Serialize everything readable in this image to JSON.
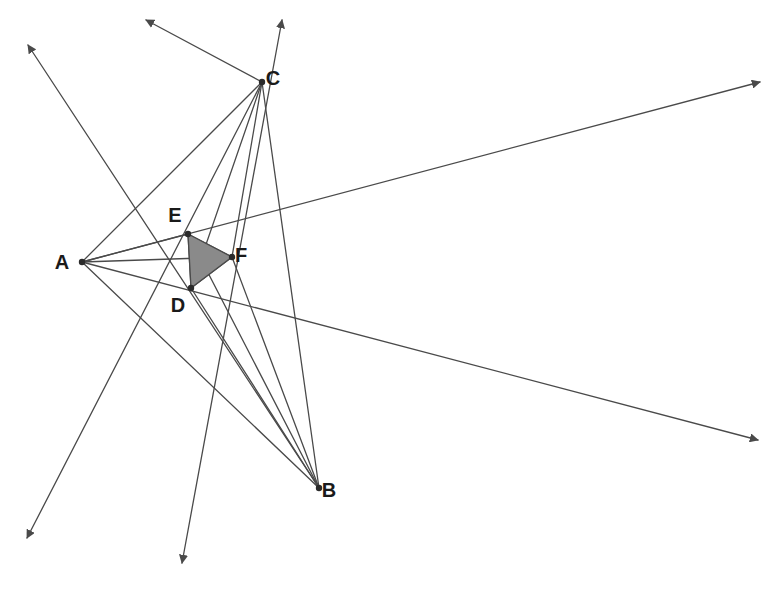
{
  "figure": {
    "width": 783,
    "height": 593,
    "background_color": "#ffffff",
    "line_color": "#4a4a4a",
    "line_width": 1.3,
    "vertex_color": "#2b2b2b",
    "vertex_radius": 3.2,
    "shaded_triangle": {
      "name": "triangle-def",
      "vertices": [
        "D",
        "E",
        "F"
      ],
      "fill_color": "#8a8a8a",
      "stroke_color": "#4a4a4a"
    },
    "points": [
      {
        "id": "A",
        "label": "A",
        "x": 82,
        "y": 262,
        "label_x": 62,
        "label_y": 269,
        "marker": true
      },
      {
        "id": "B",
        "label": "B",
        "x": 319,
        "y": 488,
        "label_x": 329,
        "label_y": 497,
        "marker": true
      },
      {
        "id": "C",
        "label": "C",
        "x": 262,
        "y": 82,
        "label_x": 273,
        "label_y": 85,
        "marker": true
      },
      {
        "id": "D",
        "label": "D",
        "x": 191,
        "y": 288,
        "label_x": 178,
        "label_y": 312,
        "marker": true
      },
      {
        "id": "E",
        "label": "E",
        "x": 188,
        "y": 234,
        "label_x": 175,
        "label_y": 222,
        "marker": true
      },
      {
        "id": "F",
        "label": "F",
        "x": 232,
        "y": 257,
        "label_x": 241,
        "label_y": 262,
        "marker": true
      }
    ],
    "segments": [
      {
        "name": "segment-a-c",
        "from": "A",
        "to": "C"
      },
      {
        "name": "segment-a-b",
        "from": "A",
        "to": "B"
      },
      {
        "name": "segment-c-b",
        "from": "C",
        "to": "B"
      },
      {
        "name": "segment-c-d",
        "from": "C",
        "to": "D"
      },
      {
        "name": "segment-c-f",
        "from": "C",
        "to": "F"
      },
      {
        "name": "segment-b-e",
        "from": "B",
        "to": "E"
      },
      {
        "name": "segment-b-f",
        "from": "B",
        "to": "F"
      },
      {
        "name": "segment-b-d",
        "from": "B",
        "to": "D"
      },
      {
        "name": "segment-a-e",
        "from": "A",
        "to": "E"
      },
      {
        "name": "segment-a-f",
        "from": "A",
        "to": "F"
      },
      {
        "name": "segment-d-e",
        "from": "D",
        "to": "E"
      },
      {
        "name": "segment-e-f",
        "from": "E",
        "to": "F"
      },
      {
        "name": "segment-d-f",
        "from": "D",
        "to": "F"
      }
    ],
    "rays": [
      {
        "name": "ray-upper-left-from-b",
        "x1": 319,
        "y1": 488,
        "x2": 28,
        "y2": 45,
        "arrow": "end"
      },
      {
        "name": "ray-upper-left-from-c",
        "x1": 262,
        "y1": 82,
        "x2": 146,
        "y2": 20,
        "arrow": "end"
      },
      {
        "name": "ray-lower-left-from-c",
        "x1": 262,
        "y1": 82,
        "x2": 27,
        "y2": 538,
        "arrow": "end"
      },
      {
        "name": "ray-lower-mid-down",
        "x1": 282,
        "y1": 20,
        "x2": 182,
        "y2": 563,
        "arrow": "both"
      },
      {
        "name": "ray-upper-right-from-a",
        "x1": 82,
        "y1": 262,
        "x2": 760,
        "y2": 82,
        "arrow": "end"
      },
      {
        "name": "ray-lower-right-from-a",
        "x1": 82,
        "y1": 262,
        "x2": 758,
        "y2": 440,
        "arrow": "end"
      }
    ],
    "arrowheads": [
      {
        "name": "arrowhead-top-left",
        "x": 28,
        "y": 45
      },
      {
        "name": "arrowhead-top-mid-left",
        "x": 146,
        "y": 20
      },
      {
        "name": "arrowhead-top-right",
        "x": 760,
        "y": 82
      },
      {
        "name": "arrowhead-bottom-left",
        "x": 27,
        "y": 538
      },
      {
        "name": "arrowhead-bottom-mid",
        "x": 182,
        "y": 563
      },
      {
        "name": "arrowhead-bottom-right",
        "x": 758,
        "y": 440
      }
    ]
  }
}
